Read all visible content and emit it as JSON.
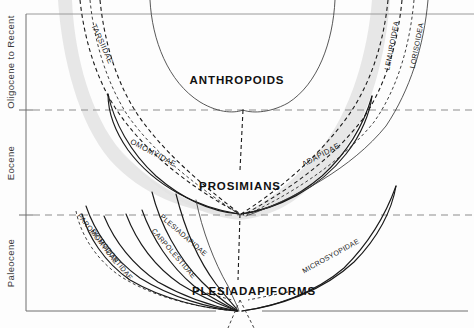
{
  "figure": {
    "kind": "phylogeny-spindle-diagram",
    "width": 474,
    "height": 328,
    "background_color": "#fdfdfd",
    "shade_color": "#e3e3e3",
    "line_color": "#1a1a1a",
    "grid_color": "#8d8d8d"
  },
  "axis": {
    "name": "geologic-time-axis",
    "orientation": "vertical",
    "epochs": [
      {
        "id": "oligocene-to-recent",
        "label": "Oligocene to Recent",
        "top": 14,
        "bottom": 110
      },
      {
        "id": "eocene",
        "label": "Eocene",
        "top": 110,
        "bottom": 215
      },
      {
        "id": "paleocene",
        "label": "Paleocene",
        "top": 215,
        "bottom": 311
      }
    ],
    "boundaries_y": [
      14,
      110,
      215,
      311
    ]
  },
  "gridlines": [
    {
      "name": "oligocene-eocene-boundary",
      "y": 110,
      "style": "dashed"
    },
    {
      "name": "eocene-paleocene-boundary",
      "y": 215,
      "style": "dashed"
    }
  ],
  "major_groups": [
    {
      "id": "anthropoids",
      "label": "ANTHROPOIDS",
      "x": 237,
      "y": 84
    },
    {
      "id": "prosimians",
      "label": "PROSIMIANS",
      "x": 240,
      "y": 190
    },
    {
      "id": "plesiadapiforms",
      "label": "PLESIADAPIFORMS",
      "x": 254,
      "y": 295
    }
  ],
  "taxa": [
    {
      "id": "tarsiidae",
      "label": "TARSIIDAE",
      "style": "dashed",
      "label_x": 100,
      "label_y": 42,
      "label_rotate": 66
    },
    {
      "id": "omomyidae",
      "label": "OMOMYIDAE",
      "style": "solid",
      "label_x": 150,
      "label_y": 153,
      "label_rotate": 28
    },
    {
      "id": "adapidae",
      "label": "ADAPIDAE",
      "style": "solid",
      "label_x": 322,
      "label_y": 155,
      "label_rotate": -28
    },
    {
      "id": "lemuroidea",
      "label": "LEMUROIDEA",
      "style": "dashed",
      "label_x": 396,
      "label_y": 44,
      "label_rotate": -78
    },
    {
      "id": "lorisoidea",
      "label": "LORISOIDEA",
      "style": "dashed",
      "label_x": 419,
      "label_y": 44,
      "label_rotate": -78
    },
    {
      "id": "paromomyidae",
      "label": "PAROMOMYIDAE",
      "style": "solid",
      "label_x": 92,
      "label_y": 238,
      "label_rotate": 52
    },
    {
      "id": "picrodontidae",
      "label": "PICRODONTIDAE",
      "style": "solid",
      "label_x": 104,
      "label_y": 251,
      "label_rotate": 52
    },
    {
      "id": "plesiadapidae",
      "label": "PLESIADAPIDAE",
      "style": "solid",
      "label_x": 174,
      "label_y": 233,
      "label_rotate": 41
    },
    {
      "id": "carpolestidae",
      "label": "CARPOLESTIDAE",
      "style": "solid",
      "label_x": 166,
      "label_y": 252,
      "label_rotate": 49
    },
    {
      "id": "microsyopidae",
      "label": "MICROSYOPIDAE",
      "style": "solid",
      "label_x": 330,
      "label_y": 256,
      "label_rotate": -29
    }
  ],
  "nodes": [
    {
      "id": "prosimian-root-node",
      "x": 240,
      "y": 214
    },
    {
      "id": "anthropoid-root-node",
      "x": 243,
      "y": 110
    },
    {
      "id": "plesiadapiform-root-node",
      "x": 238,
      "y": 327
    }
  ]
}
